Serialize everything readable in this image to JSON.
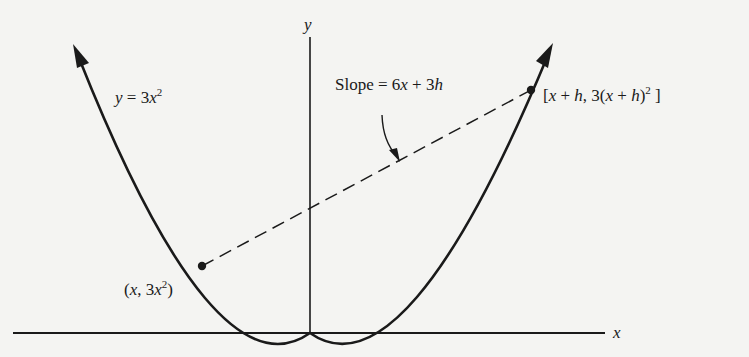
{
  "diagram": {
    "axes": {
      "x_label": "x",
      "y_label": "y"
    },
    "curve_label": {
      "lhs": "y",
      "eq": " = 3",
      "var": "x",
      "exp": "2"
    },
    "slope_label": {
      "prefix": "Slope = 6",
      "x": "x",
      "mid": " + 3",
      "h": "h"
    },
    "point_lower": {
      "open": "(",
      "x": "x",
      "mid": ", 3",
      "x2": "x",
      "exp": "2",
      "close": ")"
    },
    "point_upper": {
      "open": "[",
      "x": "x",
      "plus": " + ",
      "h": "h",
      "mid": ", 3(",
      "x2": "x",
      "plus2": " + ",
      "h2": "h",
      "close1": ")",
      "exp": "2",
      "close2": " ]"
    },
    "colors": {
      "ink": "#1a1a1a",
      "paper": "#f4f4f2"
    }
  }
}
